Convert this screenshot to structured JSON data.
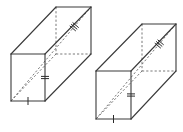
{
  "figure": {
    "colors": {
      "edge": "#3a3a3a",
      "hidden": "#6a6a6a",
      "background": "#ffffff"
    },
    "prisms": [
      {
        "id": "left",
        "front": {
          "tl": [
            11,
            54
          ],
          "tr": [
            45,
            54
          ],
          "br": [
            45,
            101
          ],
          "bl": [
            11,
            101
          ]
        },
        "back": {
          "tl": [
            56,
            7
          ],
          "tr": [
            91,
            7
          ],
          "br": [
            91,
            54
          ],
          "bl": [
            56,
            54
          ]
        },
        "diagonal": {
          "from": [
            11,
            101
          ],
          "to": [
            91,
            7
          ]
        },
        "ticks": {
          "width_marks": 1,
          "height_marks": 2,
          "depth_marks": 3
        }
      },
      {
        "id": "right",
        "front": {
          "tl": [
            96,
            71
          ],
          "tr": [
            131,
            71
          ],
          "br": [
            131,
            119
          ],
          "bl": [
            96,
            119
          ]
        },
        "back": {
          "tl": [
            142,
            24
          ],
          "tr": [
            176,
            24
          ],
          "br": [
            176,
            71
          ],
          "bl": [
            142,
            71
          ]
        },
        "diagonal": {
          "from": [
            96,
            119
          ],
          "to": [
            176,
            24
          ]
        },
        "ticks": {
          "width_marks": 1,
          "height_marks": 2,
          "depth_marks": 3
        }
      }
    ]
  }
}
